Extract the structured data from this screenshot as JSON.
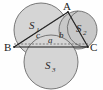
{
  "figure": {
    "background_color": "#fefefe",
    "fill_color": "#d5d5d5",
    "fill_color_dark": "#c2c2c2",
    "stroke_color": "#555555",
    "line_color": "#1c1c1c",
    "vertices": [
      {
        "name": "A",
        "label": "A",
        "x": 68,
        "y": 12
      },
      {
        "name": "B",
        "label": "B",
        "x": 14,
        "y": 47
      },
      {
        "name": "C",
        "label": "C",
        "x": 88,
        "y": 47
      }
    ],
    "regions": [
      {
        "name": "S1",
        "label": "S",
        "sub": "1",
        "x": 34,
        "y": 25
      },
      {
        "name": "S2",
        "label": "S",
        "sub": "2",
        "x": 80,
        "y": 28
      },
      {
        "name": "S3",
        "label": "S",
        "sub": "3",
        "x": 48,
        "y": 66
      }
    ],
    "sides": [
      {
        "name": "c",
        "label": "c",
        "x": 38,
        "y": 36
      },
      {
        "name": "b",
        "label": "b",
        "x": 61,
        "y": 36
      },
      {
        "name": "a",
        "label": "a",
        "x": 50,
        "y": 45
      }
    ]
  }
}
